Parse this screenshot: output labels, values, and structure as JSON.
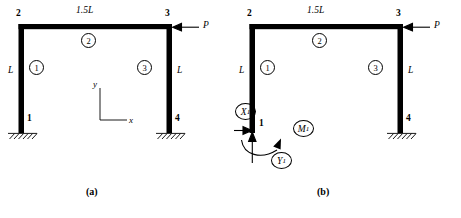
{
  "figure": {
    "type": "structural-frame-diagram",
    "panels": [
      {
        "id": "a",
        "caption": "(a)",
        "nodes": [
          {
            "label": "2",
            "x": 22,
            "y": 24,
            "label_x": 16,
            "label_y": 9
          },
          {
            "label": "3",
            "x": 170,
            "y": 24,
            "label_x": 165,
            "label_y": 9
          },
          {
            "label": "1",
            "x": 22,
            "y": 131,
            "label_x": 32,
            "label_y": 118
          },
          {
            "label": "4",
            "x": 170,
            "y": 131,
            "label_x": 175,
            "label_y": 118
          }
        ],
        "members": [
          {
            "number": "1",
            "circle_x": 36,
            "circle_y": 67
          },
          {
            "number": "2",
            "circle_x": 88,
            "circle_y": 39
          },
          {
            "number": "3",
            "circle_x": 144,
            "circle_y": 67
          }
        ],
        "dimensions": [
          {
            "text": "1.5L",
            "x": 83,
            "y": 8
          },
          {
            "text": "L",
            "x": 9,
            "y": 68
          },
          {
            "text": "L",
            "x": 177,
            "y": 68
          }
        ],
        "load": {
          "label": "P",
          "x": 204,
          "y": 24,
          "arrow_from_x": 200,
          "arrow_to_x": 175
        },
        "axes": {
          "x_label": "x",
          "y_label": "y",
          "origin_x": 100,
          "origin_y": 120
        }
      },
      {
        "id": "b",
        "caption": "(b)",
        "nodes": [
          {
            "label": "2",
            "x": 22,
            "y": 24,
            "label_x": 16,
            "label_y": 9
          },
          {
            "label": "3",
            "x": 170,
            "y": 24,
            "label_x": 165,
            "label_y": 9
          },
          {
            "label": "1",
            "x": 22,
            "y": 131,
            "label_x": 32,
            "label_y": 118
          },
          {
            "label": "4",
            "x": 170,
            "y": 131,
            "label_x": 175,
            "label_y": 118
          }
        ],
        "members": [
          {
            "number": "1",
            "circle_x": 36,
            "circle_y": 67
          },
          {
            "number": "2",
            "circle_x": 88,
            "circle_y": 39
          },
          {
            "number": "3",
            "circle_x": 144,
            "circle_y": 67
          }
        ],
        "dimensions": [
          {
            "text": "1.5L",
            "x": 83,
            "y": 8
          },
          {
            "text": "L",
            "x": 9,
            "y": 68
          },
          {
            "text": "L",
            "x": 177,
            "y": 68
          }
        ],
        "load": {
          "label": "P",
          "x": 204,
          "y": 24,
          "arrow_from_x": 200,
          "arrow_to_x": 175
        },
        "reactions": [
          {
            "symbol": "X",
            "subscript": "1",
            "circle_x": 4,
            "circle_y": 103,
            "kind": "horizontal-force"
          },
          {
            "symbol": "M",
            "subscript": "1",
            "circle_x": 62,
            "circle_y": 120,
            "kind": "moment"
          },
          {
            "symbol": "Y",
            "subscript": "1",
            "circle_x": 40,
            "circle_y": 152,
            "kind": "vertical-force"
          }
        ]
      }
    ]
  },
  "colors": {
    "member": "#000000",
    "line": "#000000",
    "background": "#ffffff"
  }
}
